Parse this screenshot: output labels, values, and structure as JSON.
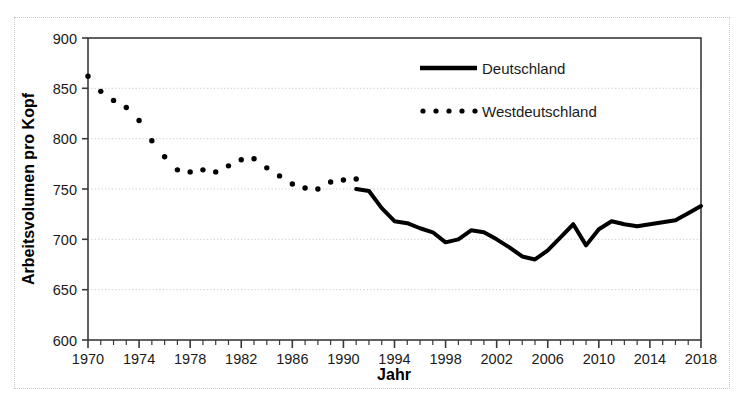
{
  "chart_data": {
    "type": "line",
    "title": "",
    "xlabel": "Jahr",
    "ylabel": "Arbeitsvolumen pro Kopf",
    "xlim": [
      1970,
      2018
    ],
    "ylim": [
      600,
      900
    ],
    "yticks": [
      600,
      650,
      700,
      750,
      800,
      850,
      900
    ],
    "xticks": [
      1970,
      1974,
      1978,
      1982,
      1986,
      1990,
      1994,
      1998,
      2002,
      2006,
      2010,
      2014,
      2018
    ],
    "xtick_minor_step": 1,
    "grid": "horizontal-dotted",
    "legend_position": "top-center-right",
    "series": [
      {
        "name": "Deutschland",
        "style": "solid",
        "color": "#000000",
        "linewidth": 4,
        "x": [
          1991,
          1992,
          1993,
          1994,
          1995,
          1996,
          1997,
          1998,
          1999,
          2000,
          2001,
          2002,
          2003,
          2004,
          2005,
          2006,
          2007,
          2008,
          2009,
          2010,
          2011,
          2012,
          2013,
          2014,
          2015,
          2016,
          2017,
          2018
        ],
        "values": [
          750,
          748,
          731,
          718,
          716,
          711,
          707,
          697,
          700,
          709,
          707,
          700,
          692,
          683,
          680,
          689,
          702,
          715,
          694,
          710,
          718,
          715,
          713,
          715,
          717,
          719,
          726,
          733
        ]
      },
      {
        "name": "Westdeutschland",
        "style": "dotted",
        "color": "#000000",
        "marker": "circle",
        "markersize": 5,
        "x": [
          1970,
          1971,
          1972,
          1973,
          1974,
          1975,
          1976,
          1977,
          1978,
          1979,
          1980,
          1981,
          1982,
          1983,
          1984,
          1985,
          1986,
          1987,
          1988,
          1989,
          1990,
          1991
        ],
        "values": [
          862,
          847,
          838,
          831,
          818,
          798,
          782,
          769,
          767,
          769,
          767,
          773,
          779,
          780,
          771,
          763,
          755,
          751,
          750,
          757,
          759,
          760
        ]
      }
    ],
    "annotations": []
  },
  "axes": {
    "y_axis_title": "Arbeitsvolumen pro Kopf",
    "x_axis_title": "Jahr",
    "y_tick_labels": [
      "900",
      "850",
      "800",
      "750",
      "700",
      "650",
      "600"
    ],
    "x_tick_labels": [
      "1970",
      "1974",
      "1978",
      "1982",
      "1986",
      "1990",
      "1994",
      "1998",
      "2002",
      "2006",
      "2010",
      "2014",
      "2018"
    ]
  },
  "legend": {
    "items": [
      {
        "label": "Deutschland",
        "style": "solid"
      },
      {
        "label": "Westdeutschland",
        "style": "dotted"
      }
    ]
  },
  "colors": {
    "line": "#000000",
    "grid": "#c9c9c9",
    "frame": "#3a3a3a",
    "background": "#ffffff"
  }
}
